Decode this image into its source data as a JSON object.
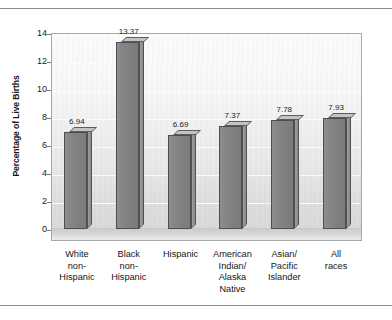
{
  "figure": {
    "y_axis_title": "Percentage of Live Births"
  },
  "chart_data": {
    "type": "bar",
    "title": "",
    "xlabel": "",
    "ylabel": "Percentage of Live Births",
    "ylim": [
      0,
      14
    ],
    "ytick_labels": [
      "14",
      "12",
      "10",
      "8",
      "6",
      "4",
      "2",
      "0"
    ],
    "ytick_values": [
      14,
      12,
      10,
      8,
      6,
      4,
      2,
      0
    ],
    "grid": true,
    "legend": "none",
    "style": "3d-bar",
    "bar_color": "#82828 4",
    "categories": [
      "White non-Hispanic",
      "Black non-Hispanic",
      "Hispanic",
      "American Indian/ Alaska Native",
      "Asian/ Pacific Islander",
      "All races"
    ],
    "category_lines": [
      [
        "White",
        "non-",
        "Hispanic"
      ],
      [
        "Black",
        "non-",
        "Hispanic"
      ],
      [
        "Hispanic"
      ],
      [
        "American",
        "Indian/",
        "Alaska",
        "Native"
      ],
      [
        "Asian/",
        "Pacific",
        "Islander"
      ],
      [
        "All",
        "races"
      ]
    ],
    "values": [
      6.94,
      13.37,
      6.69,
      7.37,
      7.78,
      7.93
    ],
    "value_labels": [
      "6.94",
      "13.37",
      "6.69",
      "7.37",
      "7.78",
      "7.93"
    ]
  }
}
